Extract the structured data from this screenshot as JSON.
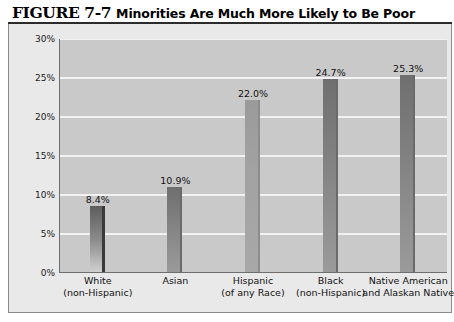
{
  "figure": {
    "number_label": "FIGURE 7-7",
    "title": "Minorities Are Much More Likely to Be Poor"
  },
  "chart_data": {
    "type": "bar",
    "title": "Minorities Are Much More Likely to Be Poor",
    "xlabel": "",
    "ylabel": "",
    "ylim": [
      0,
      30
    ],
    "grid": true,
    "legend": "none",
    "categories": [
      "White (non-Hispanic)",
      "Asian",
      "Hispanic (of any Race)",
      "Black (non-Hispanic)",
      "Native American and Alaskan Native"
    ],
    "category_lines": [
      [
        "White",
        "(non-Hispanic)"
      ],
      [
        "Asian",
        ""
      ],
      [
        "Hispanic",
        "(of any Race)"
      ],
      [
        "Black",
        "(non-Hispanic)"
      ],
      [
        "Native American",
        "and Alaskan Native"
      ]
    ],
    "values": [
      8.4,
      10.9,
      22.0,
      24.7,
      25.3
    ],
    "data_labels": [
      "8.4%",
      "10.9%",
      "22.0%",
      "24.7%",
      "25.3%"
    ],
    "ytick_labels": [
      "30%",
      "25%",
      "20%",
      "15%",
      "10%",
      "5%",
      "0%"
    ],
    "ytick_values": [
      30,
      25,
      20,
      15,
      10,
      5,
      0
    ],
    "colors": {
      "plot_background": "#c9c9c9",
      "panel_background": "#e9e9e9",
      "gridline": "#f2f2f2",
      "bar_dark": "#5e5e5e",
      "bar_light": "#cfcfcf",
      "axis": "#6e6e6e",
      "text": "#111111"
    }
  }
}
